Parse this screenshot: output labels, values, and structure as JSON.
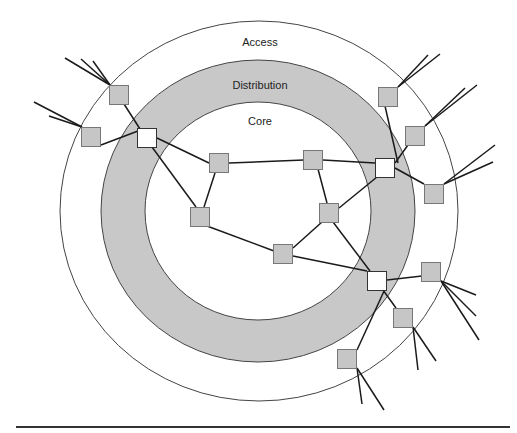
{
  "diagram": {
    "type": "hierarchical-network",
    "colors": {
      "background": "#ffffff",
      "distribution_ring": "#c8c8c8",
      "node_fill": "#c6c6c6",
      "node_fill_distribution": "#ffffff",
      "node_stroke": "#777777",
      "link": "#1a1a1a",
      "ring_stroke": "#444444"
    },
    "layers": [
      {
        "id": "access",
        "label": "Access",
        "cx": 259,
        "cy": 211,
        "rx": 199,
        "ry": 190,
        "label_x": 260,
        "label_y": 46
      },
      {
        "id": "distribution",
        "label": "Distribution",
        "cx": 258,
        "cy": 211,
        "rx": 157,
        "ry": 151,
        "label_x": 260,
        "label_y": 89
      },
      {
        "id": "core",
        "label": "Core",
        "cx": 258,
        "cy": 211,
        "rx": 113,
        "ry": 109,
        "label_x": 260,
        "label_y": 125
      }
    ],
    "nodes": [
      {
        "id": "c1",
        "layer": "core",
        "x": 219,
        "y": 163
      },
      {
        "id": "c2",
        "layer": "core",
        "x": 313,
        "y": 160
      },
      {
        "id": "c3",
        "layer": "core",
        "x": 200,
        "y": 217
      },
      {
        "id": "c4",
        "layer": "core",
        "x": 329,
        "y": 213
      },
      {
        "id": "c5",
        "layer": "core",
        "x": 283,
        "y": 254
      },
      {
        "id": "d1",
        "layer": "distribution",
        "x": 147,
        "y": 138
      },
      {
        "id": "d2",
        "layer": "distribution",
        "x": 385,
        "y": 168
      },
      {
        "id": "d3",
        "layer": "distribution",
        "x": 377,
        "y": 281
      },
      {
        "id": "a1",
        "layer": "access",
        "x": 119,
        "y": 95
      },
      {
        "id": "a2",
        "layer": "access",
        "x": 91,
        "y": 137
      },
      {
        "id": "a3",
        "layer": "access",
        "x": 388,
        "y": 97
      },
      {
        "id": "a4",
        "layer": "access",
        "x": 415,
        "y": 136
      },
      {
        "id": "a5",
        "layer": "access",
        "x": 434,
        "y": 194
      },
      {
        "id": "a6",
        "layer": "access",
        "x": 431,
        "y": 272
      },
      {
        "id": "a7",
        "layer": "access",
        "x": 403,
        "y": 318
      },
      {
        "id": "a8",
        "layer": "access",
        "x": 347,
        "y": 359
      }
    ],
    "links": [
      {
        "from": [
          157,
          138
        ],
        "to": [
          209,
          163
        ]
      },
      {
        "from": [
          229,
          163
        ],
        "to": [
          304,
          160
        ]
      },
      {
        "from": [
          152,
          147
        ],
        "to": [
          196,
          207
        ]
      },
      {
        "from": [
          215,
          173
        ],
        "to": [
          204,
          207
        ]
      },
      {
        "from": [
          207,
          226
        ],
        "to": [
          274,
          251
        ]
      },
      {
        "from": [
          293,
          256
        ],
        "to": [
          367,
          271
        ]
      },
      {
        "from": [
          318,
          169
        ],
        "to": [
          327,
          203
        ]
      },
      {
        "from": [
          323,
          160
        ],
        "to": [
          375,
          163
        ]
      },
      {
        "from": [
          339,
          208
        ],
        "to": [
          377,
          177
        ]
      },
      {
        "from": [
          293,
          248
        ],
        "to": [
          322,
          222
        ]
      },
      {
        "from": [
          333,
          222
        ],
        "to": [
          370,
          271
        ]
      },
      {
        "from": [
          124,
          104
        ],
        "to": [
          140,
          129
        ]
      },
      {
        "from": [
          101,
          145
        ],
        "to": [
          138,
          131
        ]
      },
      {
        "from": [
          385,
          106
        ],
        "to": [
          398,
          163
        ]
      },
      {
        "from": [
          395,
          163
        ],
        "to": [
          408,
          145
        ]
      },
      {
        "from": [
          395,
          168
        ],
        "to": [
          424,
          184
        ]
      },
      {
        "from": [
          387,
          280
        ],
        "to": [
          422,
          276
        ]
      },
      {
        "from": [
          383,
          290
        ],
        "to": [
          396,
          308
        ]
      },
      {
        "from": [
          385,
          289
        ],
        "to": [
          357,
          350
        ]
      }
    ],
    "leaf_links": [
      {
        "from": [
          110,
          85
        ],
        "to": [
          65,
          58
        ]
      },
      {
        "from": [
          110,
          85
        ],
        "to": [
          81,
          59
        ]
      },
      {
        "from": [
          110,
          85
        ],
        "to": [
          93,
          61
        ]
      },
      {
        "from": [
          82,
          127
        ],
        "to": [
          34,
          102
        ]
      },
      {
        "from": [
          82,
          127
        ],
        "to": [
          49,
          116
        ]
      },
      {
        "from": [
          398,
          87
        ],
        "to": [
          428,
          55
        ]
      },
      {
        "from": [
          398,
          87
        ],
        "to": [
          440,
          54
        ]
      },
      {
        "from": [
          425,
          126
        ],
        "to": [
          465,
          88
        ]
      },
      {
        "from": [
          425,
          126
        ],
        "to": [
          477,
          85
        ]
      },
      {
        "from": [
          444,
          184
        ],
        "to": [
          495,
          145
        ]
      },
      {
        "from": [
          444,
          184
        ],
        "to": [
          493,
          162
        ]
      },
      {
        "from": [
          441,
          281
        ],
        "to": [
          476,
          295
        ]
      },
      {
        "from": [
          441,
          281
        ],
        "to": [
          476,
          316
        ]
      },
      {
        "from": [
          441,
          281
        ],
        "to": [
          479,
          340
        ]
      },
      {
        "from": [
          413,
          327
        ],
        "to": [
          418,
          370
        ]
      },
      {
        "from": [
          413,
          327
        ],
        "to": [
          436,
          361
        ]
      },
      {
        "from": [
          357,
          368
        ],
        "to": [
          362,
          404
        ]
      },
      {
        "from": [
          357,
          368
        ],
        "to": [
          384,
          410
        ]
      }
    ],
    "node_size": 19,
    "rules": {
      "top": {
        "x1": 200,
        "x2": 512,
        "y": 1
      },
      "bottom": {
        "x1": 16,
        "x2": 510,
        "y": 427
      }
    }
  }
}
